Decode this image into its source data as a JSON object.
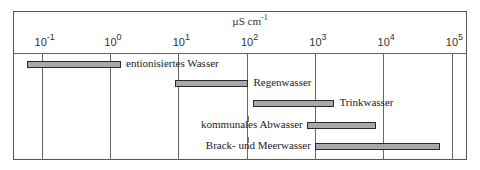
{
  "chart_data": {
    "type": "bar",
    "orientation": "horizontal-range",
    "title": "",
    "xlabel": "µS cm-1",
    "xscale": "log",
    "xlim": [
      0.05,
      150000
    ],
    "ticks": [
      {
        "base": "10",
        "exp": "-1",
        "value": 0.1
      },
      {
        "base": "10",
        "exp": "0",
        "value": 1
      },
      {
        "base": "10",
        "exp": "1",
        "value": 10
      },
      {
        "base": "10",
        "exp": "2",
        "value": 100
      },
      {
        "base": "10",
        "exp": "3",
        "value": 1000
      },
      {
        "base": "10",
        "exp": "4",
        "value": 10000
      },
      {
        "base": "10",
        "exp": "5",
        "value": 100000
      }
    ],
    "grid": "vertical lines at each decade",
    "categories": [
      "entionisiertes Wasser",
      "Regenwasser",
      "Trinkwasser",
      "kommunales Abwasser",
      "Brack- und Meerwasser"
    ],
    "series": [
      {
        "name": "min",
        "values": [
          0.06,
          9,
          125,
          760,
          1000
        ]
      },
      {
        "name": "max",
        "values": [
          1.5,
          110,
          2000,
          8000,
          70000
        ]
      }
    ],
    "legend": "none; labels beside bars"
  },
  "axis": {
    "unit_main": "µS cm",
    "unit_exp": "-1"
  }
}
